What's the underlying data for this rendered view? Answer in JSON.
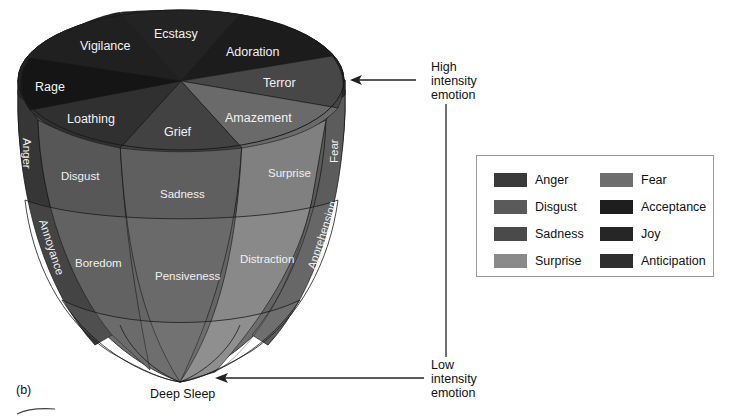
{
  "figure": {
    "panel_label": "(b)",
    "top_ring": [
      {
        "label": "Ecstasy",
        "family": "Joy"
      },
      {
        "label": "Adoration",
        "family": "Acceptance"
      },
      {
        "label": "Terror",
        "family": "Fear"
      },
      {
        "label": "Amazement",
        "family": "Surprise"
      },
      {
        "label": "Grief",
        "family": "Sadness"
      },
      {
        "label": "Loathing",
        "family": "Disgust"
      },
      {
        "label": "Rage",
        "family": "Anger"
      },
      {
        "label": "Vigilance",
        "family": "Anticipation"
      }
    ],
    "middle_ring": [
      {
        "label": "Disgust"
      },
      {
        "label": "Sadness"
      },
      {
        "label": "Surprise"
      },
      {
        "label": "Anger",
        "orientation": "vertical"
      },
      {
        "label": "Fear",
        "orientation": "vertical"
      }
    ],
    "lower_ring": [
      {
        "label": "Boredom"
      },
      {
        "label": "Pensiveness"
      },
      {
        "label": "Distraction"
      },
      {
        "label": "Annoyance",
        "orientation": "vertical"
      },
      {
        "label": "Apprehension",
        "orientation": "vertical"
      }
    ],
    "bottom_label": "Deep Sleep",
    "annotations": {
      "high": [
        "High",
        "intensity",
        "emotion"
      ],
      "low": [
        "Low",
        "intensity",
        "emotion"
      ]
    }
  },
  "legend": {
    "items": [
      {
        "label": "Anger",
        "color": "#3a3a3a"
      },
      {
        "label": "Disgust",
        "color": "#5a5a5a"
      },
      {
        "label": "Sadness",
        "color": "#4a4a4a"
      },
      {
        "label": "Surprise",
        "color": "#8a8a8a"
      },
      {
        "label": "Fear",
        "color": "#6e6e6e"
      },
      {
        "label": "Acceptance",
        "color": "#1e1e1e"
      },
      {
        "label": "Joy",
        "color": "#262626"
      },
      {
        "label": "Anticipation",
        "color": "#2e2e2e"
      }
    ]
  },
  "colors": {
    "joy_top": "#232323",
    "acceptance_top": "#1c1c1c",
    "fear_top": "#474747",
    "surprise_top": "#6a6a6a",
    "sadness_top": "#424242",
    "disgust_top": "#303030",
    "anger_top": "#151515",
    "anticipation_top": "#202020",
    "disgust_mid": "#575757",
    "sadness_mid": "#5f5f5f",
    "surprise_mid": "#808080",
    "anger_side": "#363636",
    "fear_side": "#5c5c5c",
    "disgust_low": "#626262",
    "sadness_low": "#6c6c6c",
    "surprise_low": "#8c8c8c",
    "outline": "#1a1a1a"
  }
}
